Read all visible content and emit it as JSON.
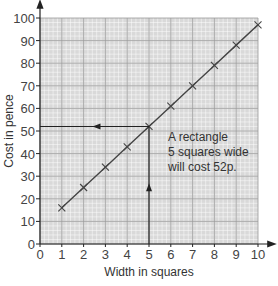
{
  "chart_data": {
    "type": "line",
    "title": "",
    "xlabel": "Width in squares",
    "ylabel": "Cost in pence",
    "x": [
      1,
      2,
      3,
      4,
      5,
      6,
      7,
      8,
      9,
      10
    ],
    "series": [
      {
        "name": "Cost",
        "values": [
          16,
          25,
          34,
          43,
          52,
          61,
          70,
          79,
          88,
          97
        ],
        "marker": "x",
        "color": "#444444"
      }
    ],
    "xlim": [
      0,
      10
    ],
    "ylim": [
      0,
      100
    ],
    "xticks": [
      0,
      1,
      2,
      3,
      4,
      5,
      6,
      7,
      8,
      9,
      10
    ],
    "yticks": [
      0,
      10,
      20,
      30,
      40,
      50,
      60,
      70,
      80,
      90,
      100
    ],
    "grid": true,
    "legend": "none",
    "annotation": {
      "lines": [
        "A rectangle",
        "5 squares wide",
        "will cost 52p."
      ],
      "read_x": 5,
      "read_y": 52
    }
  },
  "colors": {
    "grid_bg": "#d9d9d9",
    "grid_minor": "#ffffff",
    "grid_major": "#9a9a9a",
    "line": "#444444",
    "axis": "#222222"
  }
}
